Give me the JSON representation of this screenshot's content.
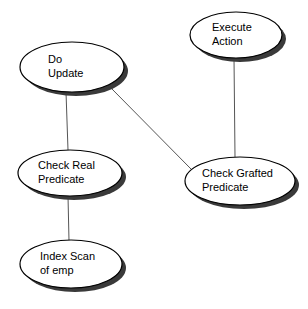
{
  "diagram": {
    "background_color": "#ffffff",
    "node_fill_color": "#ffffff",
    "node_border_color": "#000000",
    "node_shadow_color": "#3a3a3a",
    "edge_color": "#555555",
    "text_color": "#000000",
    "nodes": [
      {
        "id": "do-update",
        "shape": "ellipse",
        "cx": 72,
        "cy": 67,
        "rx": 52,
        "ry": 25,
        "lines": [
          "Do",
          "Update"
        ],
        "line1": "Do",
        "line2": "Update",
        "text_x": 48,
        "text_y1": 60,
        "text_y2": 74
      },
      {
        "id": "execute-action",
        "shape": "ellipse",
        "cx": 236,
        "cy": 35,
        "rx": 46,
        "ry": 23,
        "lines": [
          "Execute",
          "Action"
        ],
        "line1": "Execute",
        "line2": "Action",
        "text_x": 212,
        "text_y1": 28,
        "text_y2": 42
      },
      {
        "id": "check-real-predicate",
        "shape": "ellipse",
        "cx": 70,
        "cy": 173,
        "rx": 52,
        "ry": 23,
        "lines": [
          "Check Real",
          "Predicate"
        ],
        "line1": "Check Real",
        "line2": "Predicate",
        "text_x": 38,
        "text_y1": 166,
        "text_y2": 180
      },
      {
        "id": "check-grafted-predicate",
        "shape": "ellipse",
        "cx": 240,
        "cy": 181,
        "rx": 55,
        "ry": 24,
        "lines": [
          "Check Grafted",
          "Predicate"
        ],
        "line1": "Check Grafted",
        "line2": "Predicate",
        "text_x": 202,
        "text_y1": 174,
        "text_y2": 188
      },
      {
        "id": "index-scan-of-emp",
        "shape": "ellipse",
        "cx": 71,
        "cy": 264,
        "rx": 51,
        "ry": 24,
        "lines": [
          "Index Scan",
          "of emp"
        ],
        "line1": "Index Scan",
        "line2": "of emp",
        "text_x": 40,
        "text_y1": 257,
        "text_y2": 271
      }
    ],
    "edges": [
      {
        "id": "edge-do-update-check-real",
        "from": "do-update",
        "to": "check-real-predicate",
        "x1": 66,
        "y1": 92,
        "x2": 68,
        "y2": 150
      },
      {
        "id": "edge-do-update-check-grafted",
        "from": "do-update",
        "to": "check-grafted-predicate",
        "x1": 112,
        "y1": 89,
        "x2": 191,
        "y2": 169
      },
      {
        "id": "edge-execute-action-check-grafted",
        "from": "execute-action",
        "to": "check-grafted-predicate",
        "x1": 234,
        "y1": 58,
        "x2": 235,
        "y2": 157
      },
      {
        "id": "edge-check-real-index-scan",
        "from": "check-real-predicate",
        "to": "index-scan-of-emp",
        "x1": 68,
        "y1": 196,
        "x2": 69,
        "y2": 241
      }
    ]
  }
}
